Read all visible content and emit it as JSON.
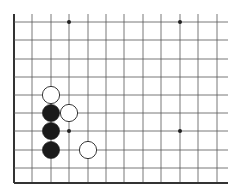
{
  "board": {
    "description": "Go board corner fragment (lower-left)",
    "line_color": "#555555",
    "edge_color": "#333333",
    "columns_x": [
      14,
      32,
      51,
      69,
      88,
      106,
      124,
      143,
      161,
      180,
      198,
      217
    ],
    "rows_y": [
      22,
      40,
      59,
      77,
      95,
      113,
      131,
      150,
      168,
      183
    ],
    "line_right_end": 228,
    "line_top_start": 14,
    "star_points": [
      {
        "x": 69,
        "y": 22
      },
      {
        "x": 180,
        "y": 22
      },
      {
        "x": 69,
        "y": 131
      },
      {
        "x": 180,
        "y": 131
      }
    ]
  },
  "stones": [
    {
      "color": "white",
      "col": 2,
      "row": 4
    },
    {
      "color": "white",
      "col": 3,
      "row": 5
    },
    {
      "color": "black",
      "col": 2,
      "row": 5
    },
    {
      "color": "black",
      "col": 2,
      "row": 6
    },
    {
      "color": "black",
      "col": 2,
      "row": 7
    },
    {
      "color": "white",
      "col": 4,
      "row": 7
    }
  ]
}
